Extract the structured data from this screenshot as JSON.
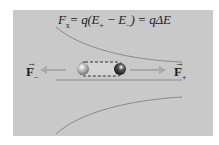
{
  "diagram": {
    "formula": {
      "lhs": "F",
      "lhs_sub": "x",
      "rhs": "= q(E",
      "sub_plus": "+",
      "mid": " − E",
      "sub_minus": "−",
      "tail": ") = qΔE"
    },
    "labels": {
      "force_minus": {
        "symbol": "F",
        "vector_mark": "→",
        "sub": "−"
      },
      "force_plus": {
        "symbol": "F",
        "vector_mark": "→",
        "sub": "+"
      }
    },
    "dipole": {
      "neg_charge": "−",
      "pos_charge": "+"
    },
    "colors": {
      "panel": "#c9c9c9",
      "field_line": "#8a8a8a",
      "arrow": "#a8a8a8",
      "text": "#222222"
    }
  }
}
